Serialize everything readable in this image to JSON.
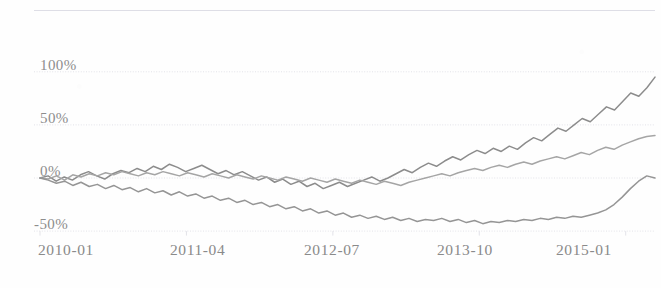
{
  "chart_data": {
    "type": "line",
    "title": "",
    "subtitle": "",
    "xlabel": "",
    "ylabel": "",
    "grid": true,
    "legend": "none",
    "xlim": [
      "2010-01",
      "2015-04"
    ],
    "ylim": [
      -75,
      115
    ],
    "ytick_values": [
      100,
      50,
      0,
      -50
    ],
    "ytick_labels": [
      "100%",
      "50%",
      "0%",
      "-50%"
    ],
    "xtick_labels": [
      "2010-01",
      "2011-04",
      "2012-07",
      "2013-10",
      "2015-01"
    ],
    "xtick_positions": [
      0,
      15,
      30,
      45,
      60
    ],
    "x_unit": "months since 2010-01",
    "colors": {
      "series_1": "#6f6f6f",
      "series_2": "#8f8f8f",
      "series_3": "#7a7a7a",
      "grid": "#d9d9e2",
      "axis_text": "#8a8a8a",
      "background": "#fefefe"
    },
    "series": [
      {
        "name": "series-1",
        "color": "#6f6f6f",
        "final_value": 95,
        "values": [
          0,
          2,
          -3,
          1,
          -2,
          3,
          6,
          2,
          -1,
          4,
          7,
          5,
          9,
          6,
          11,
          8,
          13,
          10,
          6,
          9,
          12,
          8,
          4,
          7,
          3,
          6,
          2,
          -2,
          1,
          -4,
          -1,
          -6,
          -3,
          -8,
          -5,
          -10,
          -7,
          -4,
          -8,
          -5,
          -2,
          1,
          -3,
          0,
          4,
          8,
          5,
          10,
          14,
          11,
          16,
          20,
          17,
          22,
          26,
          23,
          28,
          25,
          30,
          27,
          33,
          38,
          35,
          41,
          47,
          44,
          50,
          56,
          53,
          60,
          67,
          64,
          72,
          80,
          77,
          85,
          95
        ]
      },
      {
        "name": "series-2",
        "color": "#8f8f8f",
        "final_value": 40,
        "values": [
          0,
          -1,
          2,
          -2,
          3,
          1,
          4,
          2,
          5,
          3,
          6,
          4,
          2,
          5,
          3,
          6,
          4,
          2,
          5,
          3,
          1,
          4,
          2,
          0,
          3,
          1,
          -1,
          2,
          0,
          -2,
          1,
          -1,
          -3,
          0,
          -2,
          -4,
          -1,
          -3,
          -5,
          -2,
          -4,
          -6,
          -3,
          -5,
          -7,
          -4,
          -2,
          0,
          2,
          4,
          2,
          5,
          7,
          9,
          7,
          10,
          12,
          10,
          13,
          15,
          13,
          16,
          18,
          20,
          18,
          21,
          24,
          22,
          26,
          29,
          27,
          31,
          34,
          37,
          39,
          40
        ]
      },
      {
        "name": "series-3",
        "color": "#7a7a7a",
        "final_value": 0,
        "values": [
          0,
          -2,
          -5,
          -3,
          -7,
          -4,
          -8,
          -6,
          -10,
          -7,
          -11,
          -9,
          -13,
          -10,
          -14,
          -12,
          -16,
          -13,
          -17,
          -15,
          -19,
          -17,
          -21,
          -19,
          -23,
          -21,
          -25,
          -23,
          -27,
          -25,
          -29,
          -27,
          -31,
          -29,
          -33,
          -31,
          -35,
          -33,
          -37,
          -35,
          -38,
          -36,
          -39,
          -37,
          -40,
          -38,
          -41,
          -39,
          -40,
          -38,
          -41,
          -39,
          -42,
          -40,
          -43,
          -41,
          -42,
          -40,
          -41,
          -39,
          -40,
          -38,
          -39,
          -37,
          -38,
          -36,
          -37,
          -35,
          -33,
          -30,
          -25,
          -18,
          -10,
          -3,
          2,
          0
        ]
      }
    ]
  }
}
